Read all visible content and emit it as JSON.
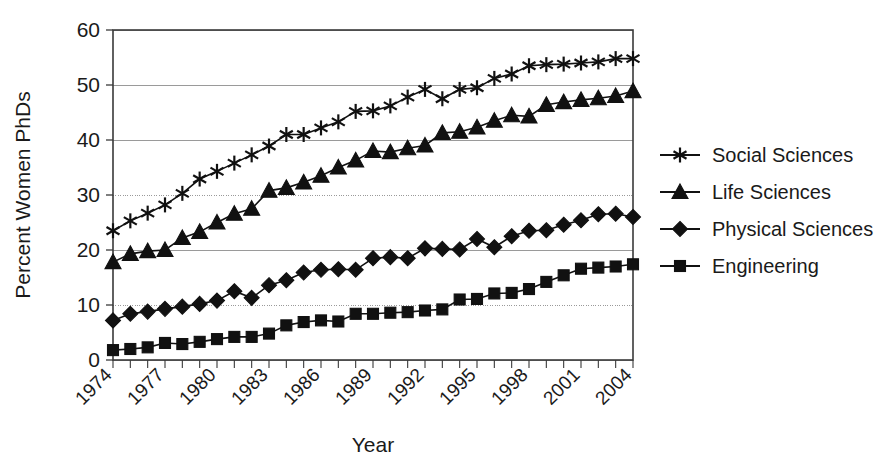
{
  "chart_data": {
    "type": "line",
    "title": "",
    "xlabel": "Year",
    "ylabel": "Percent Women PhDs",
    "xlim": [
      1974,
      2004
    ],
    "ylim": [
      0,
      60
    ],
    "ytick_interval": 10,
    "yticks": [
      "0",
      "10",
      "20",
      "30",
      "40",
      "50",
      "60"
    ],
    "xticks_all": [
      1974,
      1975,
      1976,
      1977,
      1978,
      1979,
      1980,
      1981,
      1982,
      1983,
      1984,
      1985,
      1986,
      1987,
      1988,
      1989,
      1990,
      1991,
      1992,
      1993,
      1994,
      1995,
      1996,
      1997,
      1998,
      1999,
      2000,
      2001,
      2002,
      2003,
      2004
    ],
    "xtick_labels": [
      "1974",
      "1977",
      "1980",
      "1983",
      "1986",
      "1989",
      "1992",
      "1995",
      "1998",
      "2001",
      "2004"
    ],
    "xtick_label_interval": 3,
    "grid": "horizontal",
    "legend_position": "right",
    "x": [
      1974,
      1975,
      1976,
      1977,
      1978,
      1979,
      1980,
      1981,
      1982,
      1983,
      1984,
      1985,
      1986,
      1987,
      1988,
      1989,
      1990,
      1991,
      1992,
      1993,
      1994,
      1995,
      1996,
      1997,
      1998,
      1999,
      2000,
      2001,
      2002,
      2003,
      2004
    ],
    "series": [
      {
        "name": "Social Sciences",
        "marker": "star",
        "values": [
          23.5,
          25.3,
          26.7,
          28.2,
          30.3,
          32.9,
          34.3,
          35.8,
          37.3,
          38.9,
          41.0,
          41.0,
          42.2,
          43.3,
          45.2,
          45.3,
          46.2,
          47.8,
          49.2,
          47.5,
          49.2,
          49.5,
          51.2,
          52.0,
          53.5,
          53.7,
          53.8,
          54.0,
          54.2,
          54.8,
          54.8
        ]
      },
      {
        "name": "Life Sciences",
        "marker": "triangle",
        "values": [
          17.8,
          19.3,
          19.8,
          20.0,
          22.2,
          23.3,
          25.0,
          26.6,
          27.5,
          30.8,
          31.3,
          32.3,
          33.5,
          35.0,
          36.3,
          38.0,
          37.8,
          38.5,
          39.0,
          41.3,
          41.5,
          42.3,
          43.5,
          44.5,
          44.3,
          46.4,
          46.9,
          47.3,
          47.6,
          48.0,
          48.9
        ]
      },
      {
        "name": "Physical Sciences",
        "marker": "diamond",
        "values": [
          7.2,
          8.4,
          8.8,
          9.3,
          9.7,
          10.2,
          10.8,
          12.5,
          11.3,
          13.6,
          14.5,
          15.9,
          16.4,
          16.5,
          16.4,
          18.5,
          18.7,
          18.5,
          20.3,
          20.2,
          20.1,
          22.0,
          20.5,
          22.5,
          23.5,
          23.6,
          24.6,
          25.4,
          26.5,
          26.6,
          26.0
        ]
      },
      {
        "name": "Engineering",
        "marker": "square",
        "values": [
          1.8,
          2.0,
          2.3,
          3.1,
          2.9,
          3.3,
          3.8,
          4.2,
          4.2,
          4.8,
          6.3,
          6.9,
          7.2,
          7.0,
          8.4,
          8.4,
          8.6,
          8.7,
          9.0,
          9.2,
          11.0,
          11.1,
          12.1,
          12.2,
          12.9,
          14.2,
          15.4,
          16.6,
          16.8,
          17.0,
          17.4
        ]
      }
    ]
  },
  "legend": {
    "items": [
      {
        "label": "Social Sciences",
        "marker": "star-icon"
      },
      {
        "label": "Life Sciences",
        "marker": "triangle-icon"
      },
      {
        "label": "Physical Sciences",
        "marker": "diamond-icon"
      },
      {
        "label": "Engineering",
        "marker": "square-icon"
      }
    ]
  },
  "colors": {
    "series": "#111111",
    "grid": "#9a9a9a",
    "axis": "#3a3a3a",
    "background": "#ffffff"
  }
}
